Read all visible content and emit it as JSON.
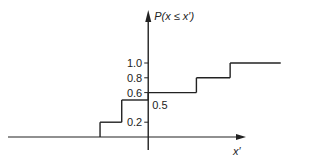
{
  "chart_data": {
    "type": "line",
    "subtype": "step",
    "title": "",
    "xlabel": "x′",
    "ylabel": "P(x ≤ x′)",
    "ylim": [
      0,
      1.0
    ],
    "y_ticks": [
      {
        "value": 1.0,
        "label": "1.0"
      },
      {
        "value": 0.8,
        "label": "0.8"
      },
      {
        "value": 0.6,
        "label": "0.6"
      },
      {
        "value": 0.2,
        "label": "0.2"
      }
    ],
    "annotations": [
      {
        "text": "0.5",
        "value": 0.5
      }
    ],
    "x_tick_labels": [],
    "grid": false,
    "legend": "none",
    "series": [
      {
        "name": "cumulative distribution",
        "steps": [
          {
            "x_start": -2.0,
            "x_end": -1.0,
            "y": 0.0
          },
          {
            "x_start": -1.0,
            "x_end": -0.55,
            "y": 0.2
          },
          {
            "x_start": -0.55,
            "x_end": 0.0,
            "y": 0.5
          },
          {
            "x_start": 0.0,
            "x_end": 1.0,
            "y": 0.6
          },
          {
            "x_start": 1.0,
            "x_end": 1.7,
            "y": 0.8
          },
          {
            "x_start": 1.7,
            "x_end": 2.75,
            "y": 1.0
          }
        ]
      }
    ],
    "xlim": [
      -2.35,
      3.15
    ]
  }
}
